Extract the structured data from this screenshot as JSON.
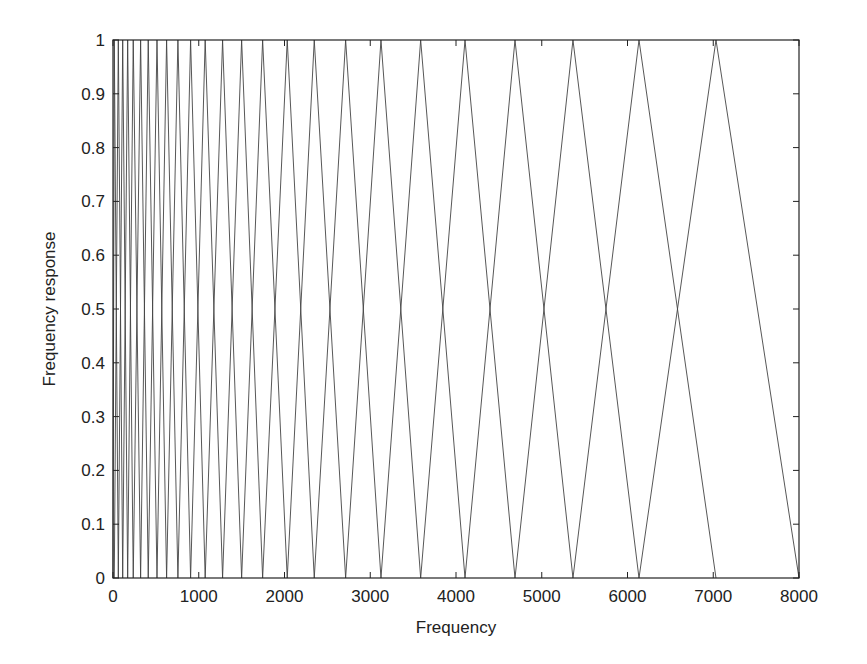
{
  "chart_data": {
    "type": "line",
    "title": "",
    "xlabel": "Frequency",
    "ylabel": "Frequency response",
    "xlim": [
      0,
      8000
    ],
    "ylim": [
      0,
      1
    ],
    "xticks": [
      0,
      1000,
      2000,
      3000,
      4000,
      5000,
      6000,
      7000,
      8000
    ],
    "xtick_labels": [
      "0",
      "1000",
      "2000",
      "3000",
      "4000",
      "5000",
      "6000",
      "7000",
      "8000"
    ],
    "yticks": [
      0,
      0.1,
      0.2,
      0.3,
      0.4,
      0.5,
      0.6,
      0.7,
      0.8,
      0.9,
      1
    ],
    "ytick_labels": [
      "0",
      "0.1",
      "0.2",
      "0.3",
      "0.4",
      "0.5",
      "0.6",
      "0.7",
      "0.8",
      "0.9",
      "1"
    ],
    "grid": false,
    "legend": null,
    "filter_edges_hz": [
      0,
      15,
      62,
      113,
      171,
      236,
      322,
      411,
      513,
      625,
      757,
      905,
      1075,
      1278,
      1500,
      1745,
      2032,
      2347,
      2713,
      3125,
      3588,
      4105,
      4688,
      5364,
      6134,
      7032,
      8000
    ],
    "filter_count": 25,
    "peak_value": 1
  }
}
